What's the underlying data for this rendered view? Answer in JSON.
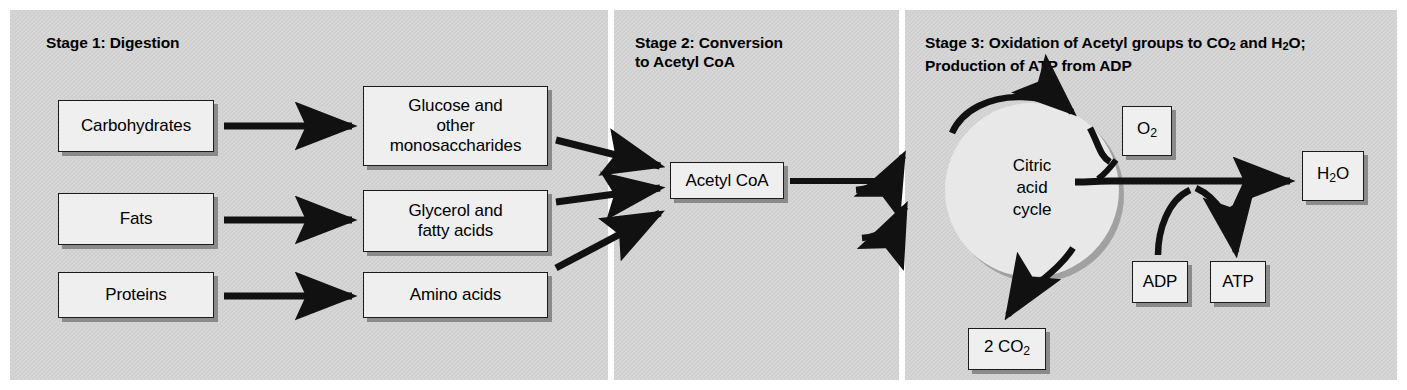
{
  "figure": {
    "background_color": "#cfcfcf",
    "box_fill": "#efefef",
    "box_border": "#1a1a1a"
  },
  "stages": [
    {
      "id": "stage-1",
      "title": "Stage 1: Digestion",
      "inputs": [
        {
          "label": "Carbohydrates"
        },
        {
          "label": "Fats"
        },
        {
          "label": "Proteins"
        }
      ],
      "products": [
        {
          "label": "Glucose and other monosaccharides",
          "lines": [
            "Glucose and",
            "other",
            "monosaccharides"
          ]
        },
        {
          "label": "Glycerol and fatty acids",
          "lines": [
            "Glycerol and",
            "fatty acids"
          ]
        },
        {
          "label": "Amino acids",
          "lines": [
            "Amino acids"
          ]
        }
      ]
    },
    {
      "id": "stage-2",
      "title_lines": [
        "Stage 2: Conversion",
        "to Acetyl CoA"
      ],
      "title": "Stage 2: Conversion to Acetyl CoA",
      "node": {
        "label": "Acetyl CoA"
      }
    },
    {
      "id": "stage-3",
      "title_line1_a": "Stage 3: Oxidation of Acetyl groups to CO",
      "title_line1_sub1": "2",
      "title_line1_b": " and H",
      "title_line1_sub2": "2",
      "title_line1_c": "O;",
      "title_line2": "Production of ATP from ADP",
      "title": "Stage 3: Oxidation of Acetyl groups to CO2 and H2O; Production of ATP from ADP",
      "cycle": {
        "lines": [
          "Citric",
          "acid",
          "cycle"
        ],
        "label": "Citric acid cycle"
      },
      "nodes": [
        {
          "id": "o2",
          "text_a": "O",
          "sub": "2",
          "text_b": "",
          "label": "O2"
        },
        {
          "id": "co2",
          "text_a": "2 CO",
          "sub": "2",
          "text_b": "",
          "label": "2 CO2"
        },
        {
          "id": "adp",
          "text_a": "ADP",
          "sub": "",
          "text_b": "",
          "label": "ADP"
        },
        {
          "id": "atp",
          "text_a": "ATP",
          "sub": "",
          "text_b": "",
          "label": "ATP"
        },
        {
          "id": "h2o",
          "text_a": "H",
          "sub": "2",
          "text_b": "O",
          "label": "H2O"
        }
      ]
    }
  ]
}
